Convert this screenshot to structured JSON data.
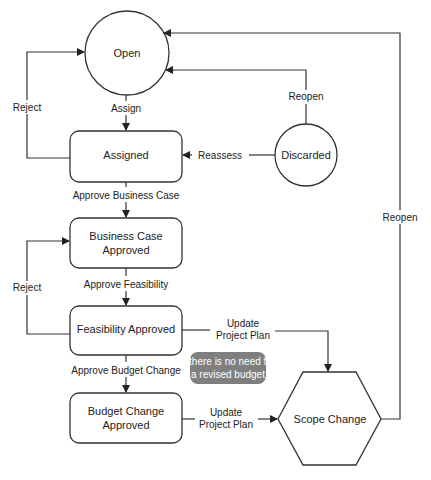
{
  "diagram": {
    "type": "state-flowchart",
    "nodes": {
      "open": {
        "label": "Open",
        "shape": "circle"
      },
      "discarded": {
        "label": "Discarded",
        "shape": "circle"
      },
      "assigned": {
        "label": "Assigned",
        "shape": "rounded-rect"
      },
      "business_case": {
        "line1": "Business Case",
        "line2": "Approved",
        "shape": "rounded-rect"
      },
      "feasibility": {
        "label": "Feasibility Approved",
        "shape": "rounded-rect"
      },
      "budget_change": {
        "line1": "Budget Change",
        "line2": "Approved",
        "shape": "rounded-rect"
      },
      "scope_change": {
        "label": "Scope Change",
        "shape": "hexagon"
      }
    },
    "edges": {
      "assign": "Assign",
      "reject_top": "Reject",
      "reassess": "Reassess",
      "reopen_discarded": "Reopen",
      "reopen_scope": "Reopen",
      "approve_business_case": "Approve Business Case",
      "approve_feasibility": "Approve Feasibility",
      "reject_mid": "Reject",
      "approve_budget_change": "Approve Budget Change",
      "update_plan_1_line1": "Update",
      "update_plan_1_line2": "Project Plan",
      "update_plan_2_line1": "Update",
      "update_plan_2_line2": "Project Plan"
    },
    "note": {
      "line1": "If there is no need for",
      "line2": "a revised budget",
      "color": "#7f7f7f"
    },
    "colors": {
      "stroke": "#333333",
      "text": "#222222",
      "background": "#ffffff"
    }
  }
}
